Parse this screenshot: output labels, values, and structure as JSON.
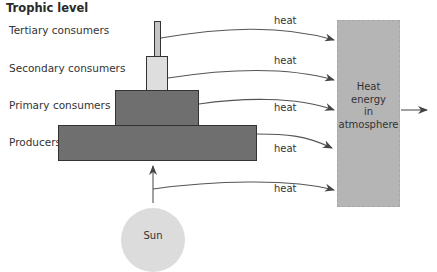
{
  "diagram": {
    "title": "Trophic level",
    "levels": [
      {
        "name": "Tertiary consumers",
        "color": "#c4c4c4"
      },
      {
        "name": "Secondary consumers",
        "color": "#dedede"
      },
      {
        "name": "Primary consumers",
        "color": "#6f6f6f"
      },
      {
        "name": "Producers",
        "color": "#6f6f6f"
      }
    ],
    "heat_labels": [
      "heat",
      "heat",
      "heat",
      "heat",
      "heat"
    ],
    "atmosphere": {
      "lines": [
        "Heat",
        "energy",
        "in",
        "atmosphere"
      ],
      "color": "#b5b5b5"
    },
    "sun": {
      "label": "Sun",
      "color": "#dcdcdc"
    }
  }
}
